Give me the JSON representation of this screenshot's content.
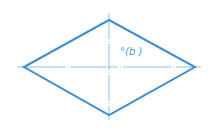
{
  "diagram": {
    "shape": "rhombus",
    "stroke_color": "#3d8fd0",
    "axis_color": "#8fc3e8",
    "vertices": {
      "left": [
        24,
        67
      ],
      "top": [
        109,
        20
      ],
      "right": [
        195,
        67
      ],
      "bottom": [
        109,
        115
      ]
    },
    "label": "°(b )"
  }
}
